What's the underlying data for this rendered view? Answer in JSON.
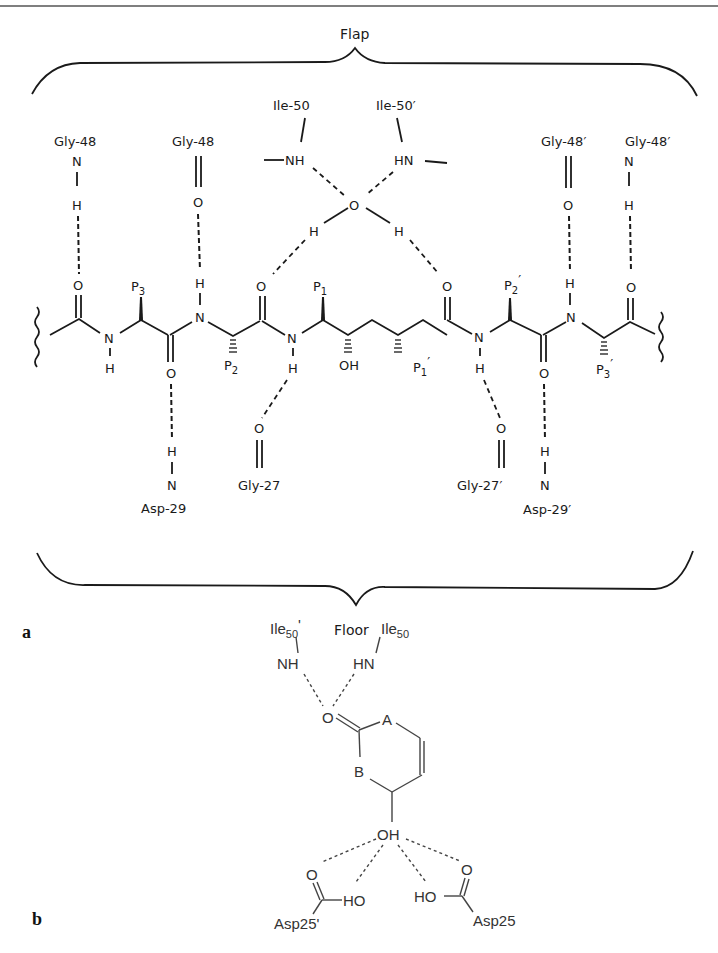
{
  "figure": {
    "panel_a": {
      "label": "a",
      "region_top": "Flap",
      "region_bottom": "Floor",
      "residues": {
        "gly48_left": "Gly-48",
        "gly48_center_left": "Gly-48",
        "ile50": "Ile-50",
        "ile50p": "Ile-50′",
        "gly48p_center_right": "Gly-48′",
        "gly48p_right": "Gly-48′",
        "asp29": "Asp-29",
        "gly27": "Gly-27",
        "gly27p": "Gly-27′",
        "asp29p": "Asp-29′"
      },
      "side_chains": {
        "p3": "P",
        "p3_sub": "3",
        "p2": "P",
        "p2_sub": "2",
        "p1": "P",
        "p1_sub": "1",
        "p1p": "P",
        "p1p_sub": "1",
        "p1p_prime": "′",
        "p2p": "P",
        "p2p_sub": "2",
        "p2p_prime": "′",
        "p3p": "P",
        "p3p_sub": "3",
        "p3p_prime": "′"
      },
      "atoms": {
        "N": "N",
        "H": "H",
        "O": "O",
        "NH": "NH",
        "HN": "HN",
        "OH": "OH"
      }
    },
    "panel_b": {
      "label": "b",
      "residues": {
        "ile50p": "Ile",
        "ile50p_sub": "50",
        "ile50p_prime": "'",
        "ile50": "Ile",
        "ile50_sub": "50",
        "asp25p": "Asp25'",
        "asp25": "Asp25"
      },
      "atoms": {
        "NH": "NH",
        "HN": "HN",
        "O": "O",
        "A": "A",
        "B": "B",
        "OH": "OH",
        "HO": "HO"
      }
    }
  }
}
